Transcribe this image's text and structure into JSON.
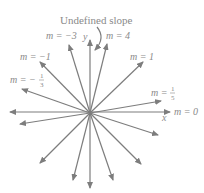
{
  "diagram": {
    "title": "Undefined slope",
    "axes": {
      "x_label": "x",
      "y_label": "y"
    },
    "origin": [
      90,
      113
    ],
    "colors": {
      "lines": "#7d7d7d",
      "text": "#8a8a8a",
      "background": "#ffffff"
    },
    "labels": {
      "undefined": "Undefined slope",
      "m_neg3": "m = −3",
      "m_4": "m = 4",
      "m_neg1": "m = −1",
      "m_1": "m = 1",
      "m_neg1_3_prefix": "m = −",
      "m_neg1_3_num": "1",
      "m_neg1_3_den": "3",
      "m_1_5_prefix": "m =",
      "m_1_5_num": "1",
      "m_1_5_den": "5",
      "m_0": "m = 0"
    },
    "lines": [
      {
        "slope": "undefined",
        "from": [
          90,
          188
        ],
        "to": [
          90,
          40
        ]
      },
      {
        "slope": "0",
        "from": [
          170,
          112
        ],
        "to": [
          10,
          112
        ]
      },
      {
        "slope": "-3",
        "from": [
          113,
          180
        ],
        "to": [
          69,
          45
        ]
      },
      {
        "slope": "4",
        "from": [
          73,
          180
        ],
        "to": [
          107,
          44
        ]
      },
      {
        "slope": "-1",
        "from": [
          141,
          164
        ],
        "to": [
          40,
          62
        ]
      },
      {
        "slope": "1",
        "from": [
          40,
          163
        ],
        "to": [
          143,
          62
        ]
      },
      {
        "slope": "-1/3",
        "from": [
          158,
          135
        ],
        "to": [
          22,
          89
        ]
      },
      {
        "slope": "1/5",
        "from": [
          20,
          124
        ],
        "to": [
          161,
          101
        ]
      }
    ]
  }
}
